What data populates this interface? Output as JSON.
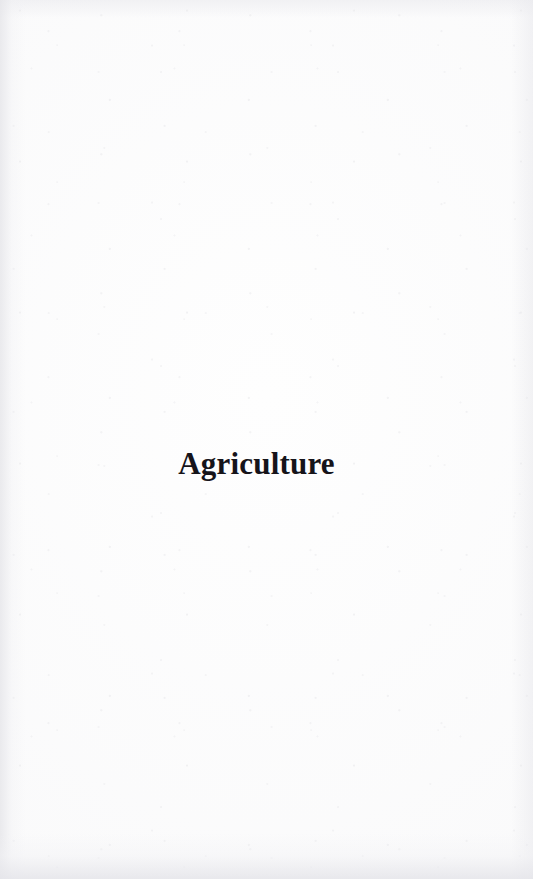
{
  "document": {
    "page_type": "section-divider",
    "background_color": "#fefefe",
    "text_color": "#16141a"
  },
  "page": {
    "section_title": "Agriculture"
  }
}
